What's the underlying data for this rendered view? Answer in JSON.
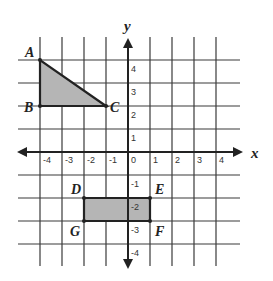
{
  "diagram": {
    "type": "coordinate-plane",
    "axes": {
      "x_label": "x",
      "y_label": "y",
      "x_ticks": [
        "-4",
        "-3",
        "-2",
        "-1",
        "0",
        "1",
        "2",
        "3",
        "4"
      ],
      "y_ticks_positive": [
        "4",
        "3",
        "2",
        "1"
      ],
      "y_ticks_negative": [
        "-1",
        "-2",
        "-3",
        "-4"
      ]
    },
    "shapes": [
      {
        "name": "triangle",
        "fill": "#b5b5b5",
        "vertices": [
          {
            "label": "A",
            "x": -4,
            "y": 4
          },
          {
            "label": "B",
            "x": -4,
            "y": 2
          },
          {
            "label": "C",
            "x": -1,
            "y": 2
          }
        ]
      },
      {
        "name": "rectangle",
        "fill": "#b5b5b5",
        "vertices": [
          {
            "label": "D",
            "x": -2,
            "y": -2
          },
          {
            "label": "E",
            "x": 1,
            "y": -2
          },
          {
            "label": "F",
            "x": 1,
            "y": -3
          },
          {
            "label": "G",
            "x": -2,
            "y": -3
          }
        ]
      }
    ],
    "labels": {
      "A": "A",
      "B": "B",
      "C": "C",
      "D": "D",
      "E": "E",
      "F": "F",
      "G": "G"
    }
  }
}
